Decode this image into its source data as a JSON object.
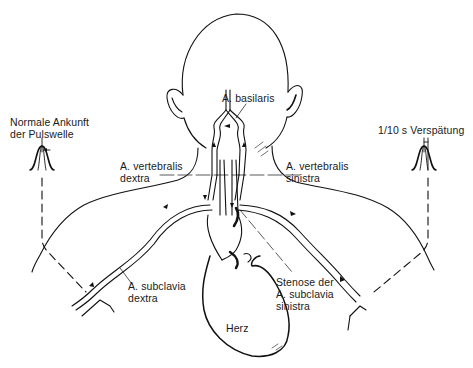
{
  "diagram": {
    "type": "anatomical",
    "colors": {
      "line": "#111111",
      "background": "#ffffff"
    },
    "labels": {
      "basilaris": "A. basilaris",
      "normal_line1": "Normale Ankunft",
      "normal_line2": "der Pulswelle",
      "delay": "1/10 s Verspätung",
      "vert_dextra_line1": "A. vertebralis",
      "vert_dextra_line2": "dextra",
      "vert_sinistra_line1": "A. vertebralis",
      "vert_sinistra_line2": "sinistra",
      "subcl_dextra_line1": "A. subclavia",
      "subcl_dextra_line2": "dextra",
      "stenose_line1": "Stenose der",
      "stenose_line2": "A. subclavia",
      "stenose_line3": "sinistra",
      "heart": "Herz"
    },
    "icons": [
      "pulse-wave-normal-icon",
      "pulse-wave-delayed-icon",
      "flow-arrow-icon"
    ]
  }
}
